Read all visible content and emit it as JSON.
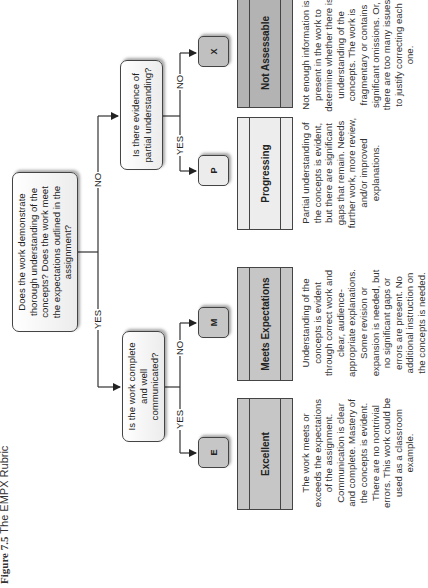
{
  "caption": {
    "prefix": "Figure 7.5",
    "title": "The EMPX Rubric"
  },
  "root_question": "Does the work demonstrate thorough understanding of the concepts? Does the work meet the expectations outlined in the assignment?",
  "branches": {
    "yes_label": "YES",
    "no_label": "NO"
  },
  "left_question": "Is the work complete and well communicated?",
  "right_question": "Is there evidence of partial understanding?",
  "outcomes": [
    {
      "letter": "E",
      "title": "Excellent",
      "branch": "YES",
      "color": "#c6c6c6",
      "letter_color": "#c6c6c6",
      "description": "The work meets or exceeds the expectations of the assignment. Communication is clear and complete. Mastery of the concepts is evident. There are no nontrivial errors. This work could be used as a classroom example."
    },
    {
      "letter": "M",
      "title": "Meets Expectations",
      "branch": "NO",
      "color": "#c6c6c6",
      "letter_color": "#c6c6c6",
      "description": "Understanding of the concepts is evident through correct work and clear, audience-appropriate explanations. Some revision or expansion is needed, but no significant gaps or errors are present. No additional instruction on the concepts is needed."
    },
    {
      "letter": "P",
      "title": "Progressing",
      "branch": "YES",
      "color": "#ededed",
      "letter_color": "#ececec",
      "description": "Partial understanding of the concepts is evident, but there are significant gaps that remain. Needs further work, more review, and/or improved explanations."
    },
    {
      "letter": "X",
      "title": "Not Assessable",
      "branch": "NO",
      "color": "#b3b3b3",
      "letter_color": "#c0c0c0",
      "description": "Not enough information is present in the work to determine whether there is understanding of the concepts. The work is fragmentary or contains significant omissions. Or, there are too many issues to justify correcting each one."
    }
  ]
}
